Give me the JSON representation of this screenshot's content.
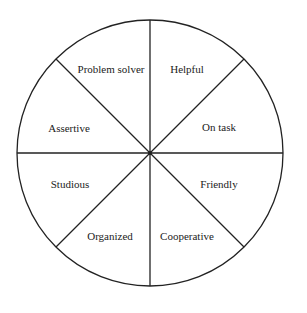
{
  "diagram": {
    "type": "pie-wheel",
    "segments": [
      {
        "label": "Helpful"
      },
      {
        "label": "On task"
      },
      {
        "label": "Friendly"
      },
      {
        "label": "Cooperative"
      },
      {
        "label": "Organized"
      },
      {
        "label": "Studious"
      },
      {
        "label": "Assertive"
      },
      {
        "label": "Problem solver"
      }
    ],
    "colors": {
      "stroke": "#222222",
      "background": "#ffffff"
    }
  }
}
